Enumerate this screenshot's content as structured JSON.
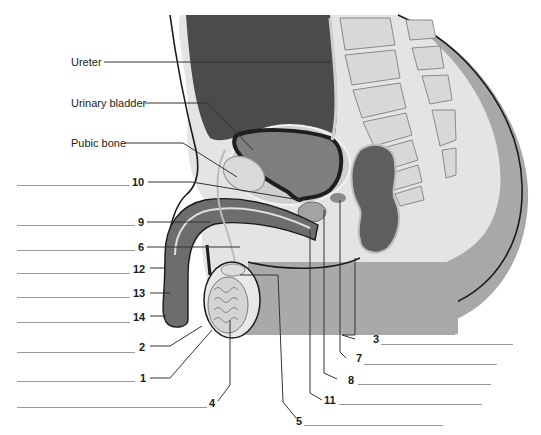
{
  "diagram": {
    "type": "anatomical-diagram",
    "colors": {
      "abdomen_dark": "#4a4a4a",
      "body_gray": "#a9a9a9",
      "light_tissue": "#e2e2e2",
      "bone": "#d9d9d9",
      "bladder_wall": "#1e1e1e",
      "outline": "#1a1a1a",
      "leader_line": "#333333",
      "answer_line": "#9a9a9a"
    },
    "named_labels": [
      {
        "id": "ureter",
        "text": "Ureter"
      },
      {
        "id": "urinary-bladder",
        "text": "Urinary bladder"
      },
      {
        "id": "pubic-bone",
        "text": "Pubic bone"
      }
    ],
    "left_numbered_labels": [
      {
        "number": "10"
      },
      {
        "number": "9"
      },
      {
        "number": "6"
      },
      {
        "number": "12"
      },
      {
        "number": "13"
      },
      {
        "number": "14"
      },
      {
        "number": "2"
      },
      {
        "number": "1"
      },
      {
        "number": "4"
      }
    ],
    "right_numbered_labels": [
      {
        "number": "3"
      },
      {
        "number": "7"
      },
      {
        "number": "8"
      },
      {
        "number": "11"
      },
      {
        "number": "5"
      }
    ]
  }
}
